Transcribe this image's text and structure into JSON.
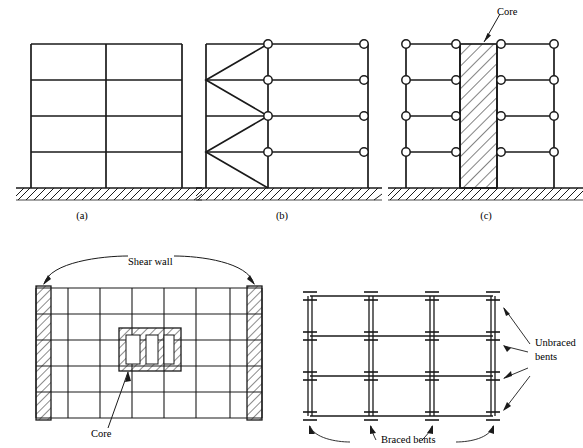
{
  "figure": {
    "kind": "structural-engineering-diagram",
    "subfigures": [
      {
        "id": "a",
        "caption": "(a)",
        "description": "rigid frame, 2 bays x 4 storeys, fixed base on hatched ground",
        "bays": 2,
        "storeys": 4,
        "joints": "rigid",
        "bracing": "none"
      },
      {
        "id": "b",
        "caption": "(b)",
        "description": "braced bent: left bay with zig-zag diagonal bracing, right bays pin-jointed",
        "bays": 3,
        "storeys": 4,
        "joints": "pinned",
        "bracing": "zig-zag diagonals",
        "pin_count": 8
      },
      {
        "id": "c",
        "caption": "(c)",
        "description": "core-braced frame: central hatched shear core with pin-jointed frames each side",
        "bays": 4,
        "storeys": 4,
        "joints": "pinned",
        "bracing": "central core",
        "pin_count": 16
      }
    ],
    "plan_left": {
      "description": "floor plan with perimeter shear walls at left and right ends and central core",
      "grid_columns": 6,
      "grid_rows": 6,
      "shear_wall_label": "Shear wall",
      "core_label": "Core",
      "core_cells": 3
    },
    "plan_right": {
      "description": "framing plan, columns shown as H sections, double lines are braced bents",
      "grid_columns": 3,
      "grid_rows": 3,
      "column_lines": 4,
      "beam_lines": 4,
      "braced_label": "Braced bents",
      "unbraced_label_line1": "Unbraced",
      "unbraced_label_line2": "bents"
    },
    "labels": {
      "core_top": "Core"
    },
    "colors": {
      "line": "#1a1a1a",
      "hatch": "#1a1a1a",
      "background": "#ffffff"
    }
  }
}
